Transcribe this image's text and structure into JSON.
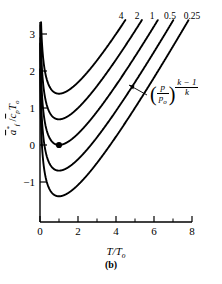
{
  "figure": {
    "caption": "(b)",
    "background": "#ffffff",
    "line_color": "#000000"
  },
  "annotation": {
    "expression_numerator": "p",
    "expression_denominator": "p",
    "expression_denominator_sub": "o",
    "exponent_numerator": "k − 1",
    "exponent_denominator": "k",
    "paren_open": "(",
    "paren_close": ")",
    "slash": "/"
  },
  "axis_titles": {
    "x": "T/T",
    "x_sub": "o",
    "y_main": "a",
    "y_star": "*",
    "y_sub_f": "f",
    "y_slash": "/",
    "y_cp": "c",
    "y_cp_sub": "p",
    "y_T": "T",
    "y_T_sub": "o",
    "y_full_text": "a*f /cp To"
  },
  "chart_data": {
    "type": "line",
    "title": "",
    "xlabel": "T/To",
    "ylabel": "a*f / cp To",
    "xlim": [
      0,
      8
    ],
    "ylim": [
      -1.85,
      3.45
    ],
    "xticks": [
      0,
      2,
      4,
      6,
      8
    ],
    "xticklabels": [
      "0",
      "2",
      "4",
      "6",
      "8"
    ],
    "xminorticks": [
      1,
      3,
      5,
      7
    ],
    "yticks": [
      -1,
      0,
      1,
      2,
      3
    ],
    "yticklabels": [
      "−1",
      "0",
      "1",
      "2",
      "3"
    ],
    "grid": false,
    "legend": "curve-end labels at top",
    "legend_title": "(p/po)^((k-1)/k)",
    "formula": "y = (T/To - 1) - ln(T/To) + ln(r)",
    "marker_points": [
      {
        "x": 1,
        "y": 0,
        "series": "1",
        "style": "filled-circle"
      }
    ],
    "series": [
      {
        "name": "4",
        "r": 4,
        "offset": 1.3863,
        "label": "4",
        "label_x": 121,
        "minimum": {
          "x": 1,
          "y": 1.3863
        }
      },
      {
        "name": "2",
        "r": 2,
        "offset": 0.6931,
        "label": "2",
        "label_x": 137,
        "minimum": {
          "x": 1,
          "y": 0.6931
        }
      },
      {
        "name": "1",
        "r": 1,
        "offset": 0.0,
        "label": "1",
        "label_x": 152,
        "minimum": {
          "x": 1,
          "y": 0.0
        }
      },
      {
        "name": "0.5",
        "r": 0.5,
        "offset": -0.6931,
        "label": "0.5",
        "label_x": 170,
        "minimum": {
          "x": 1,
          "y": -0.6931
        }
      },
      {
        "name": "0.25",
        "r": 0.25,
        "offset": -1.3863,
        "label": "0.25",
        "label_x": 192,
        "minimum": {
          "x": 1,
          "y": -1.3863
        }
      }
    ]
  }
}
